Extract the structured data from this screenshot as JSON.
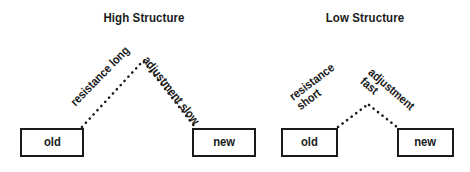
{
  "figure": {
    "background_color": "#ffffff",
    "ink_color": "#1a1a1a",
    "panels": [
      {
        "id": "high-structure",
        "title": "High Structure",
        "nodes": [
          {
            "id": "high-old",
            "label": "old"
          },
          {
            "id": "high-new",
            "label": "new"
          }
        ],
        "edges": [
          {
            "id": "high-resistance",
            "from": "high-old",
            "to": "apex",
            "style": "dotted",
            "label_lines": [
              "resistance long"
            ]
          },
          {
            "id": "high-adjustment",
            "from": "apex",
            "to": "high-new",
            "style": "dotted",
            "label_lines": [
              "adjustment slow"
            ]
          }
        ]
      },
      {
        "id": "low-structure",
        "title": "Low Structure",
        "nodes": [
          {
            "id": "low-old",
            "label": "old"
          },
          {
            "id": "low-new",
            "label": "new"
          }
        ],
        "edges": [
          {
            "id": "low-resistance",
            "from": "low-old",
            "to": "apex",
            "style": "dotted",
            "label_lines": [
              "resistance",
              "short"
            ]
          },
          {
            "id": "low-adjustment",
            "from": "apex",
            "to": "low-new",
            "style": "dotted",
            "label_lines": [
              "adjustment",
              "fast"
            ]
          }
        ]
      }
    ]
  }
}
